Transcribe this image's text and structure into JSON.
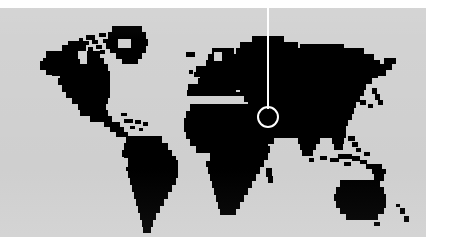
{
  "image": {
    "kind": "world-map-locator",
    "width": 453,
    "height": 251,
    "alt_text": "Pixelated black world map on a light grey panel with a white circular location marker and a vertical leader line"
  },
  "colors": {
    "page_background": "#ffffff",
    "panel_background": "#d2d2d2",
    "landmass": "#000000",
    "marker": "#ffffff"
  },
  "panel": {
    "x": 0,
    "y": 8,
    "width": 426,
    "height": 229
  },
  "marker": {
    "label": "",
    "ring_center_x": 268,
    "ring_center_y": 117,
    "ring_radius": 11,
    "ring_stroke_width": 2,
    "line_x": 267,
    "line_top_y": 8,
    "line_bottom_y": 108,
    "line_width": 2,
    "region": "Eastern Mediterranean / Middle East"
  },
  "legend": {
    "continents": [
      "North America",
      "South America",
      "Europe",
      "Africa",
      "Asia",
      "Australia"
    ]
  },
  "map_geometry": {
    "note": "Landmass rendered as a coarse pixel raster; units are 3px cells on a 142x77 grid scaled into the panel.",
    "cell": 3,
    "cols": 142,
    "rows": 77,
    "rows_data": [
      "",
      "",
      "",
      "",
      "",
      "",
      "",
      "",
      "",
      "",
      "",
      "",
      "",
      "",
      "",
      "",
      "",
      "",
      "",
      "",
      "",
      "",
      "",
      "",
      "",
      "",
      "",
      "",
      "",
      "",
      "",
      "",
      "",
      "",
      "",
      "",
      "",
      "",
      "",
      "",
      "",
      "",
      "",
      "",
      "",
      "",
      "",
      "",
      "",
      "",
      "",
      "",
      "",
      "",
      "",
      "",
      "",
      "",
      "",
      "",
      "",
      "",
      "",
      "",
      "",
      "",
      "",
      "",
      "",
      "",
      "",
      "",
      "",
      "",
      "",
      "",
      ""
    ]
  }
}
